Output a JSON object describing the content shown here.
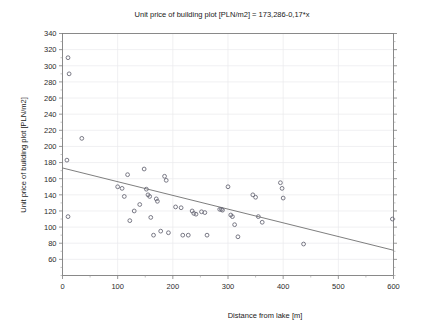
{
  "chart_data": {
    "type": "scatter",
    "title": "Unit price of building plot [PLN/m2] = 173,286-0,17*x",
    "xlabel": "Distance from lake [m]",
    "ylabel": "Unit price of building plot [PLN/m2]",
    "xlim": [
      0,
      600
    ],
    "ylim": [
      40,
      340
    ],
    "xticks": [
      0,
      100,
      200,
      300,
      400,
      500,
      600
    ],
    "xtick_labels": [
      "0",
      "100",
      "200",
      "300",
      "400",
      "500",
      "600"
    ],
    "yticks": [
      60,
      80,
      100,
      120,
      140,
      160,
      180,
      200,
      220,
      240,
      260,
      280,
      300,
      320,
      340
    ],
    "ytick_labels": [
      "60",
      "80",
      "100",
      "120",
      "140",
      "160",
      "180",
      "200",
      "220",
      "240",
      "260",
      "280",
      "300",
      "320",
      "340"
    ],
    "grid": true,
    "legend": "none",
    "series": [
      {
        "name": "Building plots",
        "marker": "open-circle",
        "color": "#6b6b78",
        "points": [
          [
            10,
            310
          ],
          [
            12,
            290
          ],
          [
            8,
            183
          ],
          [
            10,
            113
          ],
          [
            35,
            210
          ],
          [
            100,
            150
          ],
          [
            108,
            148
          ],
          [
            112,
            138
          ],
          [
            118,
            165
          ],
          [
            122,
            108
          ],
          [
            130,
            120
          ],
          [
            140,
            128
          ],
          [
            148,
            172
          ],
          [
            152,
            147
          ],
          [
            155,
            140
          ],
          [
            158,
            138
          ],
          [
            160,
            112
          ],
          [
            165,
            90
          ],
          [
            170,
            135
          ],
          [
            172,
            132
          ],
          [
            178,
            95
          ],
          [
            185,
            163
          ],
          [
            188,
            158
          ],
          [
            192,
            93
          ],
          [
            205,
            125
          ],
          [
            215,
            124
          ],
          [
            218,
            90
          ],
          [
            228,
            90
          ],
          [
            235,
            120
          ],
          [
            238,
            117
          ],
          [
            242,
            116
          ],
          [
            252,
            119
          ],
          [
            258,
            118
          ],
          [
            262,
            90
          ],
          [
            285,
            122
          ],
          [
            288,
            122
          ],
          [
            290,
            121
          ],
          [
            300,
            150
          ],
          [
            305,
            115
          ],
          [
            308,
            113
          ],
          [
            312,
            103
          ],
          [
            318,
            88
          ],
          [
            345,
            140
          ],
          [
            350,
            137
          ],
          [
            355,
            113
          ],
          [
            362,
            106
          ],
          [
            395,
            155
          ],
          [
            398,
            148
          ],
          [
            400,
            136
          ],
          [
            437,
            79
          ],
          [
            598,
            110
          ]
        ]
      }
    ],
    "regression": {
      "intercept": 173.286,
      "slope": -0.17,
      "x_start": 0,
      "x_end": 600,
      "y_start": 173.286,
      "y_end": 71.286
    }
  }
}
